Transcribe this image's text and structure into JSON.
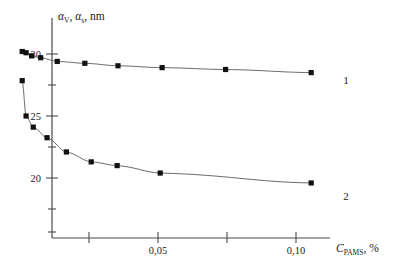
{
  "chart_data": {
    "type": "line",
    "title": "",
    "subtitle": "",
    "xlabel": "C_PAMS, %",
    "xlabel_main": "C",
    "xlabel_sub": "PAMS",
    "xlabel_tail": ", %",
    "ylabel": "αV, αs, nm",
    "ylabel_a1": "α",
    "ylabel_sub1": "V",
    "ylabel_sep": ", ",
    "ylabel_a2": "α",
    "ylabel_sub2": "s",
    "ylabel_tail": ", nm",
    "xlim": [
      0,
      0.112
    ],
    "ylim": [
      17.6,
      31.6
    ],
    "grid": false,
    "legend_position": "right-inline",
    "x_ticks": [
      0.025,
      0.05,
      0.075,
      0.1
    ],
    "x_tick_labels": [
      "",
      "0,05",
      "",
      "0,10"
    ],
    "y_ticks": [
      20,
      22.5,
      25,
      27.5,
      30
    ],
    "y_tick_labels": [
      "20",
      "",
      "25",
      "",
      "30"
    ],
    "series": [
      {
        "name": "1",
        "label": "1",
        "marker": "square",
        "color": "#111111",
        "x": [
          0.0008,
          0.0022,
          0.0042,
          0.0075,
          0.0135,
          0.0235,
          0.0355,
          0.0515,
          0.0745,
          0.1055
        ],
        "y": [
          30.2,
          30.1,
          29.85,
          29.7,
          29.4,
          29.25,
          29.05,
          28.9,
          28.75,
          28.5
        ]
      },
      {
        "name": "2",
        "label": "2",
        "marker": "square",
        "color": "#111111",
        "x": [
          0.0008,
          0.0022,
          0.0048,
          0.0098,
          0.0168,
          0.0258,
          0.0352,
          0.0508,
          0.1055
        ],
        "y": [
          27.85,
          25.0,
          24.1,
          23.25,
          22.1,
          21.3,
          21.0,
          20.4,
          19.6
        ]
      }
    ]
  },
  "annotations": {
    "curve1_label": "1",
    "curve2_label": "2"
  }
}
